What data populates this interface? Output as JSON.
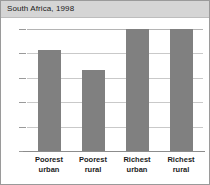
{
  "chart_data": {
    "type": "bar",
    "title": "South Africa, 1998",
    "xlabel": "",
    "ylabel": "",
    "categories": [
      "Poorest urban",
      "Poorest rural",
      "Richest urban",
      "Richest rural"
    ],
    "category_lines": [
      [
        "Poorest",
        "urban"
      ],
      [
        "Poorest",
        "rural"
      ],
      [
        "Richest",
        "urban"
      ],
      [
        "Richest",
        "rural"
      ]
    ],
    "values": [
      83,
      66,
      100,
      100
    ],
    "ylim": [
      0,
      100
    ],
    "yticks": [
      0,
      20,
      40,
      60,
      80,
      100
    ],
    "ytick_labels": [
      "0",
      "20",
      "40",
      "60",
      "80",
      "100"
    ],
    "grid": true,
    "legend": false,
    "colors": {
      "bar": "#808080",
      "grid": "#c9c9c9",
      "axis": "#8c8c8c",
      "title_band": "#d5d5d5",
      "text": "#1b1b1b",
      "border": "#9a9a9a",
      "plot_background": "#ffffff"
    }
  }
}
